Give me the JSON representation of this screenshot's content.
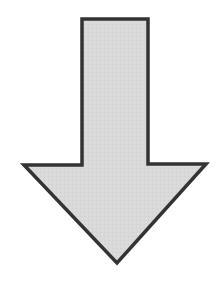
{
  "figure": {
    "shape": "down-arrow",
    "fill": "#d9d9d9",
    "stroke": "#333333",
    "stroke_width": 3.5,
    "points": "82,19 148,19 148,164 206,164 117,263 24,165 82,165"
  }
}
